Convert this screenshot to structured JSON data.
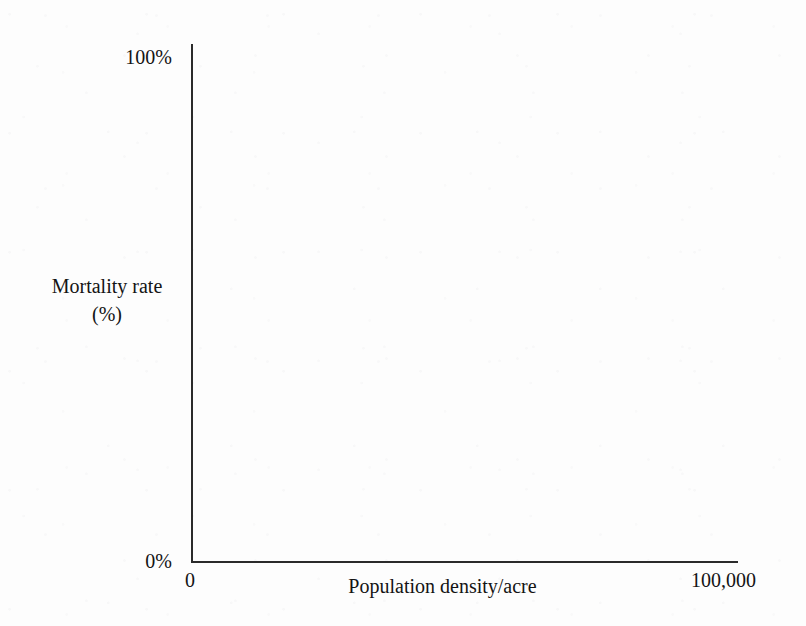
{
  "chart_data": {
    "type": "line",
    "title": "",
    "subtitle": "",
    "xlabel": "Population density/acre",
    "ylabel_line1": "Mortality rate",
    "ylabel_line2": "(%)",
    "ylabel": "Mortality rate (%)",
    "x_tick_labels": [
      "0",
      "100,000"
    ],
    "y_tick_labels": [
      "0%",
      "100%"
    ],
    "xlim": [
      0,
      100000
    ],
    "ylim": [
      0,
      100
    ],
    "grid": false,
    "legend": null,
    "annotations": [],
    "series": [],
    "x": [],
    "values": []
  },
  "figure": {
    "background_color": "#fdfdfd",
    "axis_color": "#2b2b2b",
    "text_color": "#141414"
  }
}
